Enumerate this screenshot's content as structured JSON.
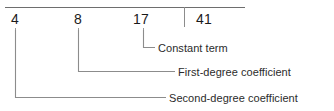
{
  "diagram": {
    "colors": {
      "background": "#ffffff",
      "rule": "#6e6e6e",
      "leader": "#8c8c8c",
      "number_text": "#1a1a1a",
      "label_text": "#2b2b2b"
    },
    "top_rule": {
      "x1": 5,
      "y": 7,
      "x2": 245
    },
    "divider": {
      "x": 184,
      "y1": 7,
      "y2": 27
    },
    "numbers": [
      {
        "value": "4",
        "x": 11,
        "y": 12,
        "tick_x": 15,
        "role": "second-degree-coefficient"
      },
      {
        "value": "8",
        "x": 74,
        "y": 12,
        "tick_x": 78,
        "role": "first-degree-coefficient"
      },
      {
        "value": "17",
        "x": 133,
        "y": 12,
        "tick_x": 143,
        "role": "constant-term"
      },
      {
        "value": "41",
        "x": 196,
        "y": 12,
        "tick_x": null,
        "role": "remainder"
      }
    ],
    "callouts": [
      {
        "id": "constant-term",
        "label": "Constant term",
        "source_value": "17",
        "leader": {
          "x": 143,
          "y_top": 30,
          "y_elbow": 48,
          "x_end": 155
        },
        "text_x": 158,
        "text_y": 43
      },
      {
        "id": "first-degree-coefficient",
        "label": "First-degree coefficient",
        "source_value": "8",
        "leader": {
          "x": 78,
          "y_top": 30,
          "y_elbow": 72,
          "x_end": 175
        },
        "text_x": 178,
        "text_y": 67
      },
      {
        "id": "second-degree-coefficient",
        "label": "Second-degree coefficient",
        "source_value": "4",
        "leader": {
          "x": 15,
          "y_top": 30,
          "y_elbow": 98,
          "x_end": 166
        },
        "text_x": 169,
        "text_y": 93
      }
    ]
  }
}
